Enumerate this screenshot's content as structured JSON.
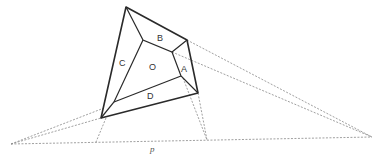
{
  "diagram": {
    "type": "perspective-polyhedron",
    "labels": {
      "A": "A",
      "B": "B",
      "C": "C",
      "D": "D",
      "O": "O",
      "p": "p"
    },
    "colors": {
      "solid": "#2a2a2a",
      "dashed": "#888888",
      "background": "#ffffff"
    }
  }
}
